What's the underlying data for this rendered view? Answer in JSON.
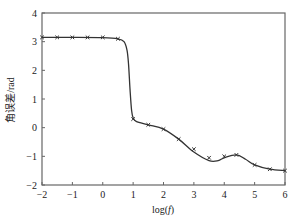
{
  "chart_data": {
    "type": "line",
    "title": "",
    "xlabel": "log(f)",
    "ylabel": "角误差/rad",
    "xlim": [
      -2,
      6
    ],
    "ylim": [
      -2,
      4
    ],
    "xticks": [
      -2,
      -1,
      0,
      1,
      2,
      3,
      4,
      5,
      6
    ],
    "yticks": [
      -2,
      -1,
      0,
      1,
      2,
      3,
      4
    ],
    "grid": false,
    "legend": null,
    "series": [
      {
        "name": "fitted-curve",
        "style": "line",
        "x": [
          -2,
          -1,
          0,
          0.5,
          0.7,
          0.8,
          0.85,
          0.9,
          0.95,
          1.0,
          1.1,
          1.5,
          2.0,
          2.5,
          3.0,
          3.5,
          3.8,
          4.0,
          4.4,
          4.7,
          5.0,
          5.5,
          6.0
        ],
        "y": [
          3.15,
          3.15,
          3.14,
          3.1,
          3.0,
          2.7,
          2.2,
          1.3,
          0.6,
          0.35,
          0.22,
          0.1,
          -0.05,
          -0.4,
          -0.85,
          -1.15,
          -1.15,
          -1.05,
          -0.95,
          -1.1,
          -1.3,
          -1.45,
          -1.5
        ]
      },
      {
        "name": "measured-points",
        "style": "marker-x",
        "x": [
          -2,
          -1.5,
          -1,
          -0.5,
          0,
          0.5,
          1.0,
          1.5,
          2.0,
          2.5,
          3.0,
          3.5,
          4.0,
          4.4,
          5.0,
          5.5,
          6.0
        ],
        "y": [
          3.15,
          3.15,
          3.15,
          3.15,
          3.15,
          3.1,
          0.3,
          0.1,
          -0.05,
          -0.4,
          -0.75,
          -1.05,
          -1.0,
          -0.95,
          -1.3,
          -1.45,
          -1.5
        ]
      }
    ]
  },
  "axes": {
    "x_title": "log(",
    "x_title_var": "f",
    "x_title_close": ")",
    "y_title": "角误差/rad"
  }
}
